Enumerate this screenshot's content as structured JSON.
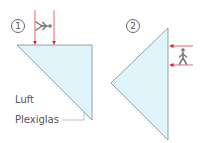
{
  "diagram": {
    "panel1": {
      "number": "1"
    },
    "panel2": {
      "number": "2"
    },
    "labels": {
      "air": "Luft",
      "plexiglass": "Plexiglas"
    },
    "colors": {
      "prism_fill": "#dff5fa",
      "prism_stroke": "#7a8a90",
      "ray": "#e0203a",
      "figure": "#777777"
    }
  }
}
